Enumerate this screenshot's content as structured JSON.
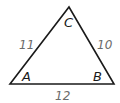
{
  "diagram": {
    "type": "triangle",
    "vertices": [
      {
        "name": "A",
        "x": 10,
        "y": 84
      },
      {
        "name": "B",
        "x": 114,
        "y": 84
      },
      {
        "name": "C",
        "x": 69,
        "y": 7
      }
    ],
    "vertex_labels": {
      "A": "A",
      "B": "B",
      "C": "C"
    },
    "side_labels": {
      "AC": "11",
      "BC": "10",
      "AB": "12"
    },
    "colors": {
      "stroke": "#1a1a1a",
      "side_text": "#6b6b6b",
      "vertex_text": "#1a1a1a"
    }
  }
}
